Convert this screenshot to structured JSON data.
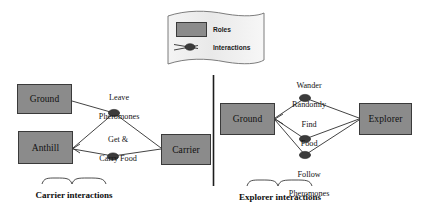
{
  "figure": {
    "title_visible": false,
    "background_color": "#ffffff",
    "role_fill_color": "#8b8b8b",
    "role_border_color": "#3a3a3a",
    "interaction_dot_color": "#3b3b3b",
    "line_color": "#2e2e2e",
    "divider_color": "#1c1c1c"
  },
  "legend": {
    "shape": "wavy-banner",
    "fill_color": "#eeeeee",
    "items": [
      {
        "icon": "gray-rectangle-swatch",
        "label": "Roles"
      },
      {
        "icon": "line-with-dot-swatch",
        "label": "Interactions"
      }
    ]
  },
  "panels": [
    {
      "id": "carrier",
      "caption": "Carrier interactions",
      "roles": [
        {
          "id": "ground-left",
          "label": "Ground"
        },
        {
          "id": "anthill",
          "label": "Anthill"
        },
        {
          "id": "carrier",
          "label": "Carrier"
        }
      ],
      "interactions": [
        {
          "id": "leave-pheromones",
          "label_line1": "Leave",
          "label_line2": "Pheromones",
          "between": [
            "Ground",
            "Carrier"
          ]
        },
        {
          "id": "get-carry-food",
          "label_line1": "Get &",
          "label_line2": "Carry Food",
          "between": [
            "Anthill",
            "Carrier"
          ]
        }
      ]
    },
    {
      "id": "explorer",
      "caption": "Explorer interactions",
      "roles": [
        {
          "id": "ground-right",
          "label": "Ground"
        },
        {
          "id": "explorer",
          "label": "Explorer"
        }
      ],
      "interactions": [
        {
          "id": "wander-randomly",
          "label_line1": "Wander",
          "label_line2": "Randomly",
          "between": [
            "Ground",
            "Explorer"
          ]
        },
        {
          "id": "find-food",
          "label_line1": "Find",
          "label_line2": "Food",
          "between": [
            "Ground",
            "Explorer"
          ]
        },
        {
          "id": "follow-pheromones",
          "label_line1": "Follow",
          "label_line2": "Pheromones",
          "between": [
            "Ground",
            "Explorer"
          ]
        }
      ]
    }
  ]
}
